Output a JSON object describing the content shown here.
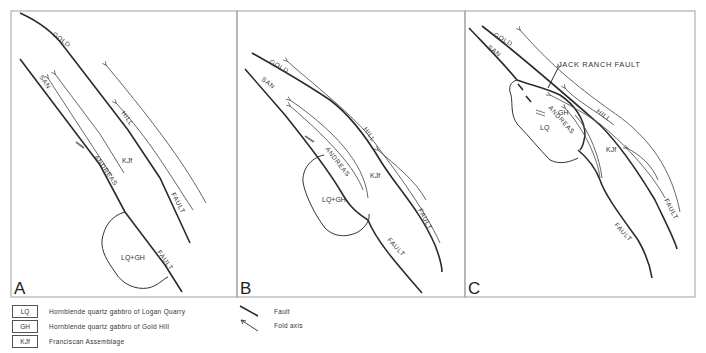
{
  "figure": {
    "panels": [
      {
        "id": "A",
        "letter": "A",
        "labels": {
          "gold": "GOLD",
          "hill": "HILL",
          "fault_upper": "FAULT",
          "san": "SAN",
          "andreas": "ANDREAS",
          "fault_lower": "FAULT",
          "unit_kjf": "KJf",
          "unit_body": "LQ+GH"
        }
      },
      {
        "id": "B",
        "letter": "B",
        "labels": {
          "gold": "GOLD",
          "hill": "HILL",
          "fault_upper": "FAULT",
          "san": "SAN",
          "andreas": "ANDREAS",
          "fault_lower": "FAULT",
          "unit_kjf": "KJf",
          "unit_body": "LQ+GH"
        }
      },
      {
        "id": "C",
        "letter": "C",
        "labels": {
          "gold": "GOLD",
          "hill": "HILL",
          "fault_upper": "FAULT",
          "san": "SAN",
          "andreas": "ANDREAS",
          "fault_lower": "FAULT",
          "unit_kjf": "KJf",
          "unit_gh": "GH",
          "unit_lq": "LQ",
          "jack_ranch": "JACK RANCH FAULT"
        }
      }
    ]
  },
  "legend": {
    "units": [
      {
        "code": "LQ",
        "description": "Hornblende quartz gabbro of Logan Quarry"
      },
      {
        "code": "GH",
        "description": "Hornblende quartz gabbro of Gold Hill"
      },
      {
        "code": "KJf",
        "description": "Franciscan Assemblage"
      }
    ],
    "symbols": [
      {
        "icon": "fault-line-icon",
        "label": "Fault"
      },
      {
        "icon": "fold-axis-arrow-icon",
        "label": "Fold axis"
      }
    ]
  },
  "colors": {
    "line": "#2b2b2b",
    "border": "#9a9a9a",
    "background": "#ffffff"
  }
}
